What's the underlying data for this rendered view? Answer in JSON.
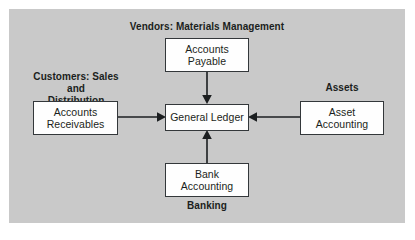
{
  "diagram": {
    "background_color": "#c9c9c9",
    "box_fill_color": "#fefefe",
    "box_border_color": "#33373a",
    "text_color": "#1b1e20",
    "labels": {
      "vendors": "Vendors: Materials Management",
      "customers": "Customers: Sales and\nDistribution",
      "assets": "Assets",
      "banking": "Banking"
    },
    "nodes": {
      "accounts_payable": "Accounts\nPayable",
      "general_ledger": "General Ledger",
      "accounts_receivables": "Accounts\nReceivables",
      "asset_accounting": "Asset\nAccounting",
      "bank_accounting": "Bank\nAccounting"
    },
    "connections": [
      {
        "from": "accounts_payable",
        "to": "general_ledger",
        "direction": "down"
      },
      {
        "from": "accounts_receivables",
        "to": "general_ledger",
        "direction": "right"
      },
      {
        "from": "asset_accounting",
        "to": "general_ledger",
        "direction": "left"
      },
      {
        "from": "bank_accounting",
        "to": "general_ledger",
        "direction": "up"
      }
    ]
  }
}
